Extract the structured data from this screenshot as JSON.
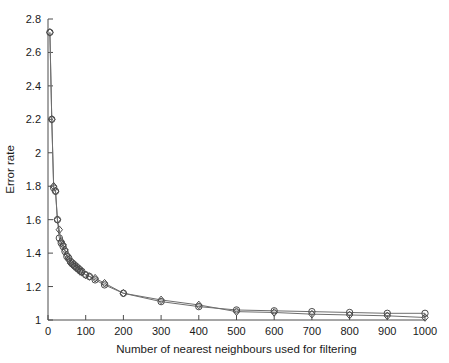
{
  "chart_data": {
    "type": "line",
    "title": "",
    "xlabel": "Number of nearest neighbours used for filtering",
    "ylabel": "Error rate",
    "xlim": [
      0,
      1000
    ],
    "ylim": [
      1,
      2.8
    ],
    "xticks": [
      0,
      100,
      200,
      300,
      400,
      500,
      600,
      700,
      800,
      900,
      1000
    ],
    "xtick_labels": [
      "0",
      "100",
      "200",
      "300",
      "400",
      "500",
      "600",
      "700",
      "800",
      "900",
      "1000"
    ],
    "yticks": [
      1,
      1.2,
      1.4,
      1.6,
      1.8,
      2,
      2.2,
      2.4,
      2.6,
      2.8
    ],
    "ytick_labels": [
      "1",
      "1.2",
      "1.4",
      "1.6",
      "1.8",
      "2",
      "2.2",
      "2.4",
      "2.6",
      "2.8"
    ],
    "grid": false,
    "legend": "none",
    "series": [
      {
        "name": "circle-series",
        "marker": "circle",
        "color": "#4a4a4a",
        "x": [
          5,
          10,
          15,
          20,
          25,
          30,
          35,
          40,
          45,
          50,
          55,
          60,
          65,
          70,
          75,
          80,
          85,
          90,
          100,
          110,
          125,
          150,
          200,
          300,
          400,
          500,
          600,
          700,
          800,
          900,
          1000
        ],
        "y": [
          2.72,
          2.2,
          1.79,
          1.77,
          1.6,
          1.49,
          1.46,
          1.44,
          1.41,
          1.38,
          1.37,
          1.35,
          1.34,
          1.33,
          1.32,
          1.31,
          1.3,
          1.29,
          1.27,
          1.26,
          1.24,
          1.21,
          1.16,
          1.11,
          1.08,
          1.06,
          1.055,
          1.05,
          1.045,
          1.04,
          1.04
        ]
      },
      {
        "name": "diamond-series",
        "marker": "diamond",
        "color": "#4a4a4a",
        "x": [
          5,
          10,
          15,
          20,
          25,
          30,
          35,
          40,
          45,
          50,
          55,
          60,
          65,
          70,
          75,
          80,
          85,
          90,
          100,
          110,
          125,
          150,
          200,
          300,
          400,
          500,
          600,
          700,
          800,
          900,
          1000
        ],
        "y": [
          2.72,
          2.2,
          1.8,
          1.77,
          1.6,
          1.54,
          1.47,
          1.45,
          1.42,
          1.39,
          1.36,
          1.34,
          1.33,
          1.32,
          1.31,
          1.3,
          1.29,
          1.285,
          1.27,
          1.26,
          1.25,
          1.22,
          1.16,
          1.12,
          1.09,
          1.05,
          1.045,
          1.035,
          1.03,
          1.025,
          1.015
        ]
      }
    ]
  }
}
